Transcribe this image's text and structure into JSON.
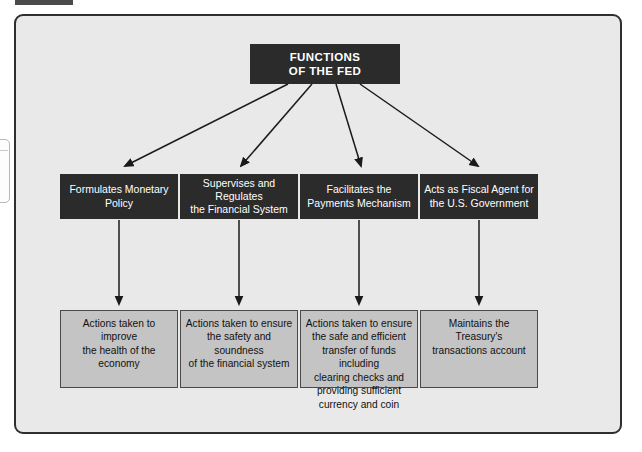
{
  "figure": {
    "title_box": {
      "line1": "FUNCTIONS",
      "line2": "OF THE FED"
    },
    "colors": {
      "panel_background": "#e9e9e9",
      "panel_border": "#2f2f2f",
      "dark_box_fill": "#2b2b2b",
      "dark_box_text": "#ffffff",
      "detail_box_fill": "#c4c4c4",
      "detail_box_border": "#4a4a4a",
      "connector": "#1a1a1a"
    },
    "columns": [
      {
        "function": {
          "line1": "Formulates Monetary",
          "line2": "Policy"
        },
        "detail": {
          "line1": "Actions taken to improve",
          "line2": "the health of the economy"
        }
      },
      {
        "function": {
          "line1": "Supervises and Regulates",
          "line2": "the Financial System"
        },
        "detail": {
          "line1": "Actions taken to ensure",
          "line2": "the safety and soundness",
          "line3": "of the financial system"
        }
      },
      {
        "function": {
          "line1": "Facilitates the",
          "line2": "Payments Mechanism"
        },
        "detail": {
          "line1": "Actions taken to ensure",
          "line2": "the safe and efficient",
          "line3": "transfer of funds including",
          "line4": "clearing checks and",
          "line5": "providing sufficient",
          "line6": "currency and coin"
        }
      },
      {
        "function": {
          "line1": "Acts as Fiscal Agent for",
          "line2": "the U.S. Government"
        },
        "detail": {
          "line1": "Maintains the Treasury's",
          "line2": "transactions account"
        }
      }
    ]
  }
}
